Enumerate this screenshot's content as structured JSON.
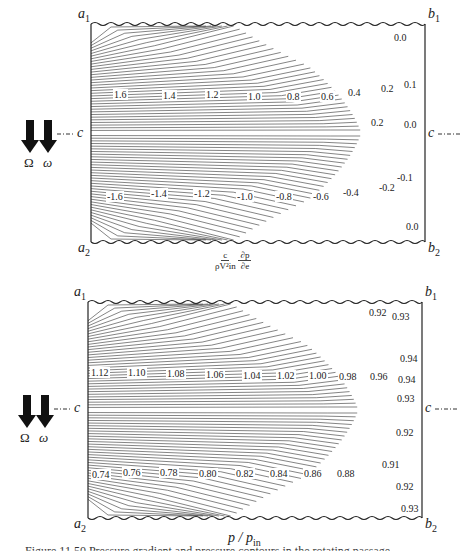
{
  "figures": [
    {
      "id": "pressure-gradient",
      "corners": {
        "a1": "a",
        "a1_sub": "1",
        "b1": "b",
        "b1_sub": "1",
        "a2": "a",
        "a2_sub": "2",
        "b2": "b",
        "b2_sub": "2"
      },
      "centerline_label": "c",
      "rotation_symbols": {
        "left": "Ω",
        "right": "ω"
      },
      "xlabel": {
        "num_left": "c",
        "den_left": "ρV²in",
        "num_right": "∂p",
        "den_right": "∂e"
      },
      "upper_labels": [
        "1.6",
        "1.4",
        "1.2",
        "1.0",
        "0.8",
        "0.6",
        "0.4",
        "0.2",
        "0.1",
        "0.0",
        "0.2",
        "0.0"
      ],
      "lower_labels": [
        "-1.6",
        "-1.4",
        "-1.2",
        "-1.0",
        "-0.8",
        "-0.6",
        "-0.4",
        "-0.2",
        "-0.1",
        "0.0"
      ]
    },
    {
      "id": "pressure-ratio",
      "corners": {
        "a1": "a",
        "a1_sub": "1",
        "b1": "b",
        "b1_sub": "1",
        "a2": "a",
        "a2_sub": "2",
        "b2": "b",
        "b2_sub": "2"
      },
      "centerline_label": "c",
      "rotation_symbols": {
        "left": "Ω",
        "right": "ω"
      },
      "xlabel": "p / p_in",
      "xlabel_main": "p / p",
      "xlabel_sub": "in",
      "upper_labels": [
        "1.12",
        "1.10",
        "1.08",
        "1.06",
        "1.04",
        "1.02",
        "1.00",
        "0.98",
        "0.96",
        "0.94",
        "0.94",
        "0.93",
        "0.92",
        "0.93"
      ],
      "lower_labels": [
        "0.74",
        "0.76",
        "0.78",
        "0.80",
        "0.82",
        "0.84",
        "0.86",
        "0.88",
        "0.91",
        "0.92",
        "0.92",
        "0.93"
      ]
    }
  ],
  "caption": "Figure 11.50  Pressure gradient and pressure contours in the rotating passage"
}
